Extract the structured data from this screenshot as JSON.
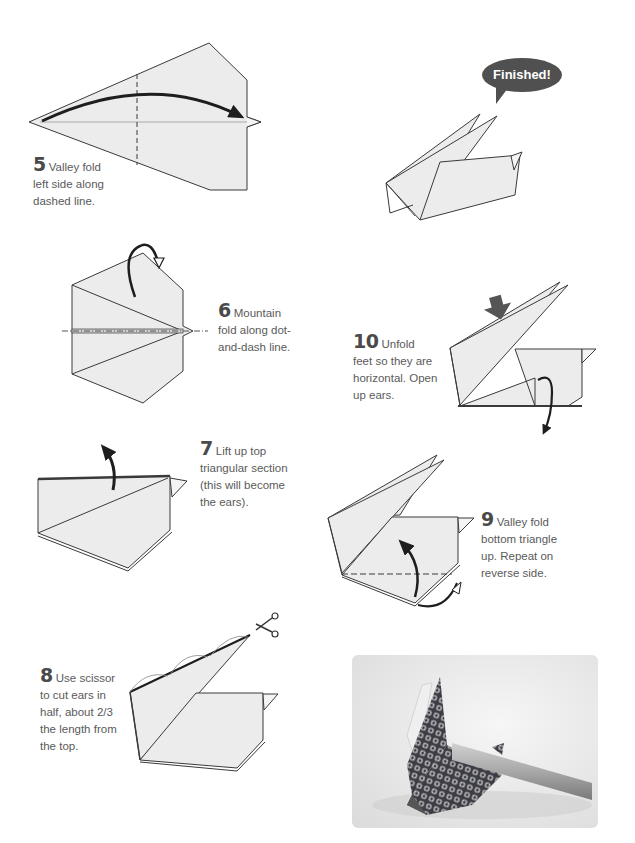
{
  "page": {
    "colors": {
      "paper_fill": "#ececec",
      "line": "#3a3a3a",
      "arrow": "#1e1e1e",
      "bubble": "#505050",
      "text": "#5a5a5a",
      "number": "#4a4a4a"
    }
  },
  "steps": [
    {
      "number": "5",
      "text": "Valley fold left side along dashed line.",
      "lines": [
        "Valley fold",
        "left side along",
        "dashed line."
      ]
    },
    {
      "number": "6",
      "text": "Mountain fold along dot-and-dash line.",
      "lines": [
        "Mountain",
        "fold along dot-",
        "and-dash line."
      ]
    },
    {
      "number": "7",
      "text": "Lift up top triangular section (this will become the ears).",
      "lines": [
        "Lift up top",
        "triangular section",
        "(this will become",
        "the ears)."
      ]
    },
    {
      "number": "8",
      "text": "Use scissor to cut ears in half, about 2/3 the length from the top.",
      "lines": [
        "Use scissor",
        "to cut ears in",
        "half, about 2/3",
        "the length from",
        "the top."
      ]
    },
    {
      "number": "9",
      "text": "Valley fold bottom triangle up. Repeat on reverse side.",
      "lines": [
        "Valley fold",
        "bottom triangle",
        "up. Repeat on",
        "reverse side."
      ]
    },
    {
      "number": "10",
      "text": "Unfold feet so they are horizontal. Open up ears.",
      "lines": [
        "Unfold",
        "feet so they are",
        "horizontal. Open",
        "up ears."
      ]
    }
  ],
  "finished": {
    "label": "Finished!"
  },
  "icons": {
    "valley_arrow": "curved-arrow",
    "mountain_arrow": "hollow-curved-arrow",
    "push_arrow": "push-arrow",
    "scissors": "scissors"
  },
  "photo": {
    "subject": "origami rabbit chopstick rest with patterned paper"
  }
}
